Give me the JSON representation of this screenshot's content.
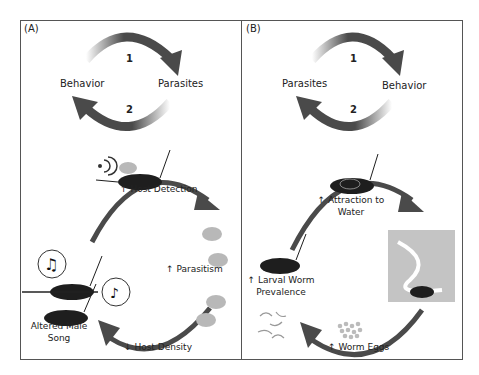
{
  "panels": {
    "A": {
      "label": "(A)",
      "cycle": {
        "left": "Behavior",
        "right": "Parasites",
        "arrow_top": "1",
        "arrow_bottom": "2"
      },
      "steps": {
        "host_detection": "↑ Host Detection",
        "parasitism": "↑ Parasitism",
        "host_density": "↓ Host Density",
        "altered_song_line1": "Altered Male",
        "altered_song_line2": "Song"
      }
    },
    "B": {
      "label": "(B)",
      "cycle": {
        "left": "Parasites",
        "right": "Behavior",
        "arrow_top": "1",
        "arrow_bottom": "2"
      },
      "steps": {
        "attraction_line1": "↑ Attraction to",
        "attraction_line2": "Water",
        "worm_eggs": "↑ Worm Eggs",
        "larval_line1": "↑ Larval Worm",
        "larval_line2": "Prevalence"
      }
    }
  },
  "colors": {
    "arrow": "#4a4a4a",
    "border": "#555555",
    "fly": "#b8b8b8",
    "cricket": "#1e1e1e",
    "river_bg": "#c4c4c4"
  }
}
